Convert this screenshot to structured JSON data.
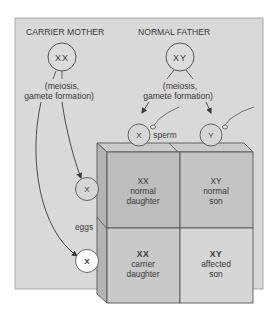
{
  "diagram": {
    "parents": {
      "mother": {
        "label": "CARRIER MOTHER",
        "genotype": "XX"
      },
      "father": {
        "label": "NORMAL FATHER",
        "genotype": "XY"
      }
    },
    "process_label_line1": "(meiosis,",
    "process_label_line2": "gamete formation)",
    "gametes": {
      "sperm_label": "sperm",
      "eggs_label": "eggs",
      "sperm": [
        {
          "chromosome": "X"
        },
        {
          "chromosome": "Y"
        }
      ],
      "eggs": [
        {
          "chromosome": "X",
          "type": "normal"
        },
        {
          "chromosome": "X",
          "type": "carrier"
        }
      ]
    },
    "punnett_square": {
      "cells": [
        {
          "genotype": "XX",
          "line1": "normal",
          "line2": "daughter"
        },
        {
          "genotype": "XY",
          "line1": "normal",
          "line2": "son"
        },
        {
          "genotype": "XX",
          "line1": "carrier",
          "line2": "daughter"
        },
        {
          "genotype": "XY",
          "line1": "affected",
          "line2": "son"
        }
      ]
    },
    "colors": {
      "background_panel": "#d9d9d9",
      "cell_top_left": "#bdbdbd",
      "cell_top_right": "#c4c4c4",
      "cell_bottom_left": "#c9c9c9",
      "cell_bottom_right": "#d6d6d6",
      "box_top": "#cacaca",
      "box_side": "#b4b4b4",
      "line": "#4a4a4a",
      "affected_egg_fill": "#ffffff"
    }
  }
}
